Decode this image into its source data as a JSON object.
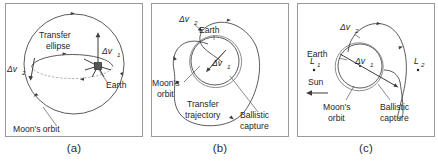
{
  "figure": {
    "panels": [
      {
        "id": "panel-a",
        "caption": "(a)",
        "labels": {
          "transfer_ellipse_line1": "Transfer",
          "transfer_ellipse_line2": "ellipse",
          "delta_v1": "Δv",
          "delta_v1_sub": "1",
          "delta_v2": "Δv",
          "delta_v2_sub": "2",
          "earth": "Earth",
          "moons_orbit": "Moon's orbit"
        }
      },
      {
        "id": "panel-b",
        "caption": "(b)",
        "labels": {
          "delta_v2": "Δv",
          "delta_v2_sub": "2",
          "delta_v1": "Δv",
          "delta_v1_sub": "1",
          "earth": "Earth",
          "moons_orbit_line1": "Moon's",
          "moons_orbit_line2": "orbit",
          "transfer_trajectory_line1": "Transfer",
          "transfer_trajectory_line2": "trajectory",
          "ballistic_capture_line1": "Ballistic",
          "ballistic_capture_line2": "capture"
        }
      },
      {
        "id": "panel-c",
        "caption": "(c)",
        "labels": {
          "delta_v2": "Δv",
          "delta_v2_sub": "2",
          "delta_v1": "Δv",
          "delta_v1_sub": "1",
          "earth": "Earth",
          "l1": "L",
          "l1_sub": "1",
          "l2": "L",
          "l2_sub": "2",
          "sun": "Sun",
          "moons_orbit_line1": "Moon's",
          "moons_orbit_line2": "orbit",
          "ballistic_capture_line1": "Ballistic",
          "ballistic_capture_line2": "capture"
        }
      }
    ]
  },
  "colors": {
    "background": "#ffffff",
    "frame": "#9a9a9a",
    "stroke": "#3d3d3d",
    "text": "#262626",
    "dashed": "#8c8c8c"
  }
}
